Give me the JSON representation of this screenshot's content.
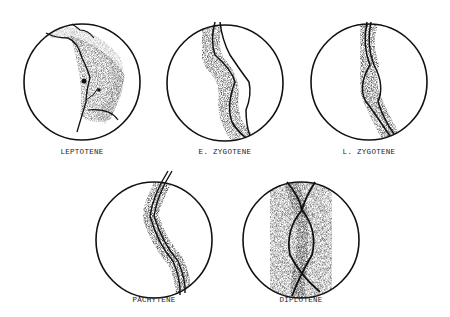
{
  "figure": {
    "stages": [
      {
        "id": "leptotene",
        "label": "LEPTOTENE",
        "cx": 82,
        "cy": 82,
        "r": 58,
        "label_y": 148
      },
      {
        "id": "early-zygotene",
        "label": "E. ZYGOTENE",
        "cx": 225,
        "cy": 83,
        "r": 58,
        "label_y": 148
      },
      {
        "id": "late-zygotene",
        "label": "L. ZYGOTENE",
        "cx": 369,
        "cy": 82,
        "r": 58,
        "label_y": 148
      },
      {
        "id": "pachytene",
        "label": "PACHYTENE",
        "cx": 154,
        "cy": 240,
        "r": 58,
        "label_y": 296
      },
      {
        "id": "diplotene",
        "label": "DIPLOTENE",
        "cx": 301,
        "cy": 240,
        "r": 58,
        "label_y": 296
      }
    ],
    "colors": {
      "ink": "#111111",
      "background": "#ffffff"
    }
  }
}
